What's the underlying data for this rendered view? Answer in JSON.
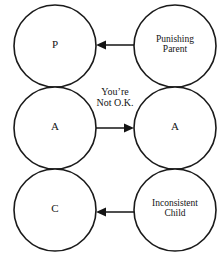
{
  "diagram": {
    "stroke_color": "#1a1a1a",
    "text_color": "#141414",
    "background_color": "#ffffff",
    "left_column": {
      "name": "Self ego states",
      "nodes": [
        {
          "id": "parent",
          "label": "P"
        },
        {
          "id": "adult",
          "label": "A"
        },
        {
          "id": "child",
          "label": "C"
        }
      ]
    },
    "right_column": {
      "name": "Other person ego states",
      "nodes": [
        {
          "id": "punishing-parent",
          "line1": "Punishing",
          "line2": "Parent"
        },
        {
          "id": "adult-right",
          "line1": "A",
          "line2": ""
        },
        {
          "id": "inconsistent-child",
          "line1": "Inconsistent",
          "line2": "Child"
        }
      ]
    },
    "arrows": [
      {
        "id": "arrow-top",
        "direction": "left",
        "from": "punishing-parent",
        "to": "parent"
      },
      {
        "id": "arrow-middle",
        "direction": "right",
        "from": "adult",
        "to": "adult-right"
      },
      {
        "id": "arrow-bottom",
        "direction": "left",
        "from": "inconsistent-child",
        "to": "child"
      }
    ],
    "edge_labels": [
      {
        "id": "youre-not-ok",
        "line1": "You’re",
        "line2": "Not O.K."
      }
    ]
  }
}
